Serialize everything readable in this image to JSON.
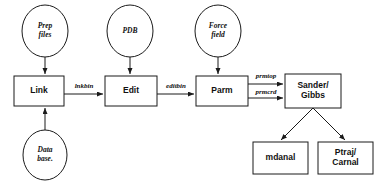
{
  "diagram": {
    "type": "flowchart",
    "canvas": {
      "width": 387,
      "height": 182
    },
    "colors": {
      "background": "#ffffff",
      "stroke": "#1a1a1a",
      "node_fill": "#ffffff",
      "text": "#111111"
    },
    "input_nodes": [
      {
        "id": "prep_files",
        "shape": "ellipse",
        "line1": "Prep",
        "line2": "files",
        "cx": 45,
        "cy": 31,
        "rx": 23,
        "ry": 26
      },
      {
        "id": "pdb",
        "shape": "ellipse",
        "line1": "PDB",
        "line2": "",
        "cx": 130,
        "cy": 31,
        "rx": 23,
        "ry": 26
      },
      {
        "id": "force_field",
        "shape": "ellipse",
        "line1": "Force",
        "line2": "field",
        "cx": 218,
        "cy": 31,
        "rx": 23,
        "ry": 26
      },
      {
        "id": "data_base",
        "shape": "ellipse",
        "line1": "Data",
        "line2": "base.",
        "cx": 45,
        "cy": 155,
        "rx": 22,
        "ry": 25
      }
    ],
    "program_nodes": [
      {
        "id": "link",
        "shape": "box",
        "line1": "Link",
        "line2": "",
        "x": 14,
        "y": 76,
        "w": 50,
        "h": 30
      },
      {
        "id": "edit",
        "shape": "box",
        "line1": "Edit",
        "line2": "",
        "x": 105,
        "y": 76,
        "w": 52,
        "h": 30
      },
      {
        "id": "parm",
        "shape": "box",
        "line1": "Parm",
        "line2": "",
        "x": 196,
        "y": 76,
        "w": 52,
        "h": 30
      },
      {
        "id": "sander_gibbs",
        "shape": "box",
        "line1": "Sander/",
        "line2": "Gibbs",
        "x": 285,
        "y": 74,
        "w": 56,
        "h": 34
      },
      {
        "id": "mdanal",
        "shape": "box",
        "line1": "mdanal",
        "line2": "",
        "x": 253,
        "y": 142,
        "w": 55,
        "h": 32
      },
      {
        "id": "ptraj_carnal",
        "shape": "box",
        "line1": "Ptraj/",
        "line2": "Carnal",
        "x": 318,
        "y": 142,
        "w": 55,
        "h": 32
      }
    ],
    "edges": [
      {
        "id": "prep-to-link",
        "from": "prep_files",
        "to": "link",
        "x1": 45,
        "y1": 57,
        "x2": 45,
        "y2": 74,
        "label": ""
      },
      {
        "id": "database-to-link",
        "from": "data_base",
        "to": "link",
        "x1": 45,
        "y1": 130,
        "x2": 45,
        "y2": 108,
        "label": ""
      },
      {
        "id": "pdb-to-edit",
        "from": "pdb",
        "to": "edit",
        "x1": 130,
        "y1": 57,
        "x2": 130,
        "y2": 74,
        "label": ""
      },
      {
        "id": "forcefield-to-parm",
        "from": "force_field",
        "to": "parm",
        "x1": 218,
        "y1": 57,
        "x2": 218,
        "y2": 74,
        "label": ""
      },
      {
        "id": "link-to-edit",
        "from": "link",
        "to": "edit",
        "x1": 64,
        "y1": 94,
        "x2": 103,
        "y2": 94,
        "label": "lnkbin",
        "lx": 84,
        "ly": 86
      },
      {
        "id": "edit-to-parm",
        "from": "edit",
        "to": "parm",
        "x1": 157,
        "y1": 94,
        "x2": 194,
        "y2": 94,
        "label": "editbin",
        "lx": 176,
        "ly": 86
      },
      {
        "id": "parm-to-sander-top",
        "from": "parm",
        "to": "sander_gibbs",
        "x1": 248,
        "y1": 84,
        "x2": 283,
        "y2": 84,
        "label": "prmtop",
        "lx": 266,
        "ly": 76
      },
      {
        "id": "parm-to-sander-bottom",
        "from": "parm",
        "to": "sander_gibbs",
        "x1": 248,
        "y1": 98,
        "x2": 283,
        "y2": 98,
        "label": "prmcrd",
        "lx": 266,
        "ly": 92
      },
      {
        "id": "sander-to-mdanal",
        "from": "sander_gibbs",
        "to": "mdanal",
        "x1": 313,
        "y1": 108,
        "x2": 281,
        "y2": 140,
        "label": ""
      },
      {
        "id": "sander-to-ptraj",
        "from": "sander_gibbs",
        "to": "ptraj_carnal",
        "x1": 313,
        "y1": 108,
        "x2": 345,
        "y2": 140,
        "label": ""
      }
    ]
  }
}
